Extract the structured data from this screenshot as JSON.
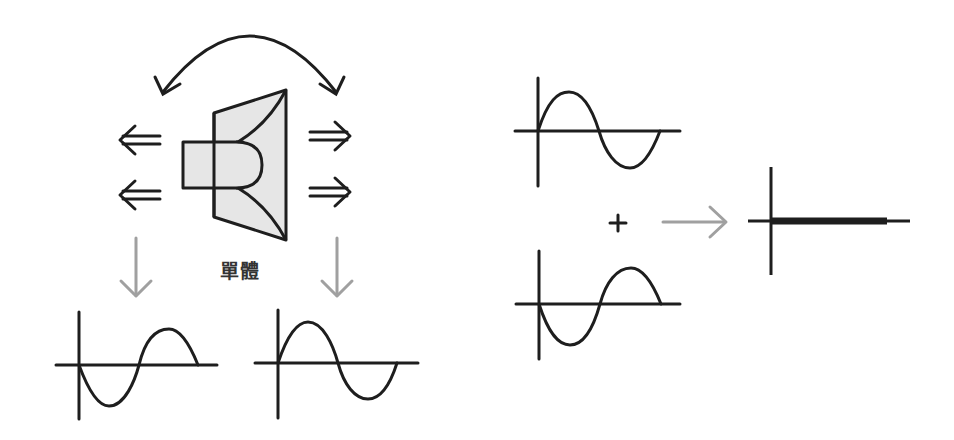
{
  "diagram": {
    "speaker_label": "單體",
    "colors": {
      "stroke": "#1e1e1e",
      "speaker_fill": "#e6e6e6",
      "gray_arrow": "#a0a0a0"
    },
    "left_panel": {
      "description": "Speaker driver radiating sound forward and backward in opposite phase",
      "waves": [
        {
          "name": "rear-wave",
          "phase": "inverted"
        },
        {
          "name": "front-wave",
          "phase": "normal"
        }
      ]
    },
    "right_panel": {
      "operator": "+",
      "waves": [
        {
          "name": "wave-a",
          "phase": "normal"
        },
        {
          "name": "wave-b",
          "phase": "inverted"
        }
      ],
      "result": "cancelled (flat line)"
    }
  }
}
